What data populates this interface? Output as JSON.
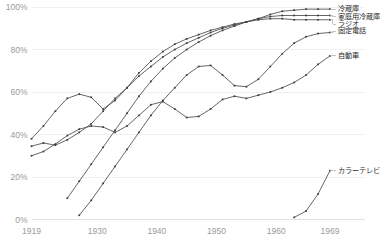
{
  "chart_data": {
    "type": "line",
    "title": "",
    "subtitle": "",
    "xlabel": "",
    "ylabel": "",
    "xlim": [
      1919,
      1969
    ],
    "ylim": [
      0,
      100
    ],
    "grid": true,
    "legend_position": "right-inline",
    "x_ticks": [
      "1919",
      "1930",
      "1940",
      "1950",
      "1960",
      "1969"
    ],
    "x_tick_values": [
      1919,
      1930,
      1940,
      1950,
      1960,
      1969
    ],
    "y_ticks": [
      "0%",
      "20%",
      "40%",
      "60%",
      "80%",
      "100%"
    ],
    "y_tick_values": [
      0,
      20,
      40,
      60,
      80,
      100
    ],
    "series": [
      {
        "name": "冷蔵庫",
        "label_x": 1970.5,
        "label_y": 99.0,
        "x": [
          1919,
          1921,
          1923,
          1925,
          1927,
          1929,
          1931,
          1933,
          1935,
          1937,
          1939,
          1941,
          1943,
          1945,
          1947,
          1949,
          1951,
          1953,
          1955,
          1957,
          1959,
          1961,
          1963,
          1965,
          1967,
          1969
        ],
        "y": [
          34.5,
          36.0,
          35.0,
          37.5,
          41.0,
          45.0,
          51.0,
          57.0,
          62.0,
          67.5,
          72.0,
          76.5,
          80.0,
          83.0,
          85.5,
          88.0,
          90.0,
          91.5,
          93.0,
          94.5,
          96.5,
          98.0,
          98.5,
          99.0,
          99.0,
          99.0
        ]
      },
      {
        "name": "家庭用冷蔵庫",
        "label_x": 1970.5,
        "label_y": 95.5,
        "x": [
          1925,
          1927,
          1929,
          1931,
          1933,
          1935,
          1937,
          1939,
          1941,
          1943,
          1945,
          1947,
          1949,
          1951,
          1953,
          1955,
          1957,
          1959,
          1961,
          1963,
          1965,
          1967,
          1969
        ],
        "y": [
          10.0,
          18.0,
          26.0,
          34.0,
          42.0,
          50.0,
          58.0,
          65.0,
          71.0,
          76.0,
          80.0,
          83.5,
          86.5,
          89.0,
          91.0,
          93.0,
          94.5,
          95.5,
          96.0,
          96.0,
          96.0,
          96.0,
          96.0
        ]
      },
      {
        "name": "ラジオ",
        "label_x": 1970.5,
        "label_y": 92.0,
        "x": [
          1919,
          1921,
          1923,
          1925,
          1927,
          1929,
          1931,
          1933,
          1935,
          1937,
          1939,
          1941,
          1943,
          1945,
          1947,
          1949,
          1951,
          1953,
          1955,
          1957,
          1959,
          1961,
          1963,
          1965,
          1967,
          1969
        ],
        "y": [
          38.0,
          44.0,
          51.0,
          57.0,
          59.0,
          57.5,
          52.0,
          56.0,
          62.0,
          69.0,
          74.5,
          79.0,
          82.5,
          85.0,
          87.0,
          89.0,
          90.5,
          92.0,
          93.0,
          94.0,
          94.5,
          94.5,
          94.0,
          94.0,
          94.0,
          94.0
        ]
      },
      {
        "name": "固定電話",
        "label_x": 1970.5,
        "label_y": 88.5,
        "x": [
          1927,
          1929,
          1931,
          1933,
          1935,
          1937,
          1939,
          1941,
          1943,
          1945,
          1947,
          1949,
          1951,
          1953,
          1955,
          1957,
          1959,
          1961,
          1963,
          1965,
          1967,
          1969
        ],
        "y": [
          2.0,
          9.0,
          17.0,
          25.0,
          33.0,
          41.0,
          49.0,
          56.0,
          62.0,
          68.0,
          72.0,
          72.5,
          68.0,
          63.0,
          62.5,
          66.0,
          72.0,
          78.0,
          83.0,
          86.0,
          87.5,
          88.0
        ]
      },
      {
        "name": "自動車",
        "label_x": 1970.5,
        "label_y": 77.0,
        "x": [
          1919,
          1921,
          1923,
          1925,
          1927,
          1929,
          1931,
          1933,
          1935,
          1937,
          1939,
          1941,
          1943,
          1945,
          1947,
          1949,
          1951,
          1953,
          1955,
          1957,
          1959,
          1961,
          1963,
          1965,
          1967,
          1969
        ],
        "y": [
          30.0,
          32.0,
          35.5,
          39.5,
          42.5,
          44.0,
          43.5,
          41.0,
          44.0,
          49.0,
          54.0,
          55.5,
          52.0,
          48.0,
          48.5,
          52.0,
          56.5,
          58.0,
          57.0,
          58.5,
          60.0,
          62.0,
          64.5,
          68.0,
          73.0,
          77.0
        ]
      },
      {
        "name": "カラーテレビ",
        "label_x": 1970.5,
        "label_y": 23.0,
        "x": [
          1963,
          1965,
          1967,
          1969
        ],
        "y": [
          1.0,
          4.0,
          12.0,
          23.0
        ]
      }
    ]
  }
}
